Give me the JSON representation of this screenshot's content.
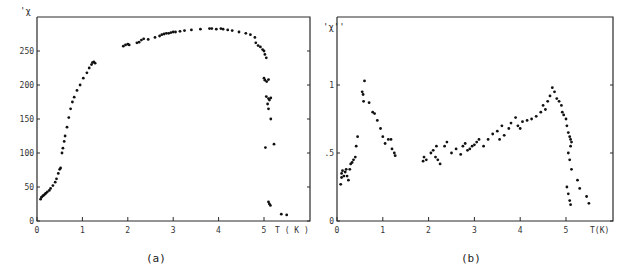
{
  "chart_data": [
    {
      "type": "scatter",
      "panel": "(a)",
      "caption": "(a)",
      "title": "",
      "ylabel": "'χ",
      "xlabel": "T(K)",
      "xlim": [
        0,
        5.8
      ],
      "ylim": [
        0,
        300
      ],
      "xticks": [
        "0",
        "1",
        "2",
        "3",
        "4",
        "5"
      ],
      "yticks": [
        "0",
        "50",
        "100",
        "150",
        "200",
        "250"
      ],
      "grid": false,
      "points": [
        [
          0.08,
          32
        ],
        [
          0.1,
          35
        ],
        [
          0.13,
          37
        ],
        [
          0.15,
          38
        ],
        [
          0.18,
          40
        ],
        [
          0.2,
          41
        ],
        [
          0.23,
          43
        ],
        [
          0.27,
          45
        ],
        [
          0.3,
          48
        ],
        [
          0.35,
          52
        ],
        [
          0.4,
          57
        ],
        [
          0.43,
          62
        ],
        [
          0.47,
          70
        ],
        [
          0.5,
          76
        ],
        [
          0.52,
          78
        ],
        [
          0.55,
          100
        ],
        [
          0.57,
          107
        ],
        [
          0.6,
          117
        ],
        [
          0.62,
          125
        ],
        [
          0.66,
          138
        ],
        [
          0.7,
          152
        ],
        [
          0.74,
          165
        ],
        [
          0.78,
          175
        ],
        [
          0.82,
          182
        ],
        [
          0.88,
          192
        ],
        [
          0.95,
          200
        ],
        [
          1.02,
          210
        ],
        [
          1.1,
          218
        ],
        [
          1.15,
          225
        ],
        [
          1.2,
          230
        ],
        [
          1.22,
          233
        ],
        [
          1.25,
          234
        ],
        [
          1.28,
          232
        ],
        [
          1.9,
          257
        ],
        [
          1.95,
          259
        ],
        [
          2.0,
          260
        ],
        [
          2.03,
          259
        ],
        [
          2.2,
          262
        ],
        [
          2.25,
          263
        ],
        [
          2.3,
          266
        ],
        [
          2.35,
          268
        ],
        [
          2.45,
          267
        ],
        [
          2.6,
          270
        ],
        [
          2.7,
          272
        ],
        [
          2.75,
          274
        ],
        [
          2.8,
          275
        ],
        [
          2.85,
          276
        ],
        [
          2.9,
          276
        ],
        [
          2.95,
          277
        ],
        [
          3.0,
          278
        ],
        [
          3.05,
          278
        ],
        [
          3.15,
          279
        ],
        [
          3.25,
          280
        ],
        [
          3.4,
          281
        ],
        [
          3.6,
          282
        ],
        [
          3.8,
          283
        ],
        [
          3.85,
          283
        ],
        [
          3.95,
          282
        ],
        [
          4.05,
          283
        ],
        [
          4.1,
          282
        ],
        [
          4.2,
          281
        ],
        [
          4.3,
          280
        ],
        [
          4.45,
          278
        ],
        [
          4.6,
          276
        ],
        [
          4.7,
          274
        ],
        [
          4.8,
          270
        ],
        [
          4.82,
          262
        ],
        [
          4.87,
          258
        ],
        [
          4.92,
          256
        ],
        [
          4.97,
          252
        ],
        [
          5.0,
          250
        ],
        [
          5.02,
          245
        ],
        [
          5.05,
          240
        ],
        [
          5.0,
          210
        ],
        [
          5.02,
          207
        ],
        [
          5.06,
          205
        ],
        [
          5.1,
          208
        ],
        [
          5.05,
          183
        ],
        [
          5.1,
          180
        ],
        [
          5.12,
          178
        ],
        [
          5.15,
          181
        ],
        [
          5.08,
          172
        ],
        [
          5.1,
          165
        ],
        [
          5.15,
          150
        ],
        [
          5.03,
          108
        ],
        [
          5.22,
          113
        ],
        [
          5.1,
          28
        ],
        [
          5.12,
          25
        ],
        [
          5.14,
          23
        ],
        [
          5.38,
          10
        ],
        [
          5.5,
          9
        ]
      ]
    },
    {
      "type": "scatter",
      "panel": "(b)",
      "caption": "(b)",
      "title": "",
      "ylabel": "'χ''",
      "xlabel": "T(K)",
      "xlim": [
        0,
        5.8
      ],
      "ylim": [
        0,
        1.5
      ],
      "xticks": [
        "0",
        "1",
        "2",
        "3",
        "4",
        "5"
      ],
      "yticks": [
        "0",
        ".5",
        "1"
      ],
      "grid": false,
      "points": [
        [
          0.08,
          0.27
        ],
        [
          0.1,
          0.32
        ],
        [
          0.1,
          0.35
        ],
        [
          0.12,
          0.37
        ],
        [
          0.15,
          0.33
        ],
        [
          0.18,
          0.36
        ],
        [
          0.2,
          0.38
        ],
        [
          0.22,
          0.33
        ],
        [
          0.25,
          0.3
        ],
        [
          0.28,
          0.38
        ],
        [
          0.3,
          0.42
        ],
        [
          0.33,
          0.43
        ],
        [
          0.36,
          0.45
        ],
        [
          0.4,
          0.47
        ],
        [
          0.42,
          0.55
        ],
        [
          0.45,
          0.62
        ],
        [
          0.55,
          0.95
        ],
        [
          0.57,
          0.93
        ],
        [
          0.6,
          1.03
        ],
        [
          0.58,
          0.88
        ],
        [
          0.7,
          0.87
        ],
        [
          0.78,
          0.8
        ],
        [
          0.82,
          0.79
        ],
        [
          0.88,
          0.74
        ],
        [
          0.95,
          0.68
        ],
        [
          1.0,
          0.62
        ],
        [
          1.05,
          0.57
        ],
        [
          1.12,
          0.6
        ],
        [
          1.18,
          0.6
        ],
        [
          1.2,
          0.53
        ],
        [
          1.25,
          0.5
        ],
        [
          1.27,
          0.48
        ],
        [
          1.88,
          0.44
        ],
        [
          1.9,
          0.47
        ],
        [
          1.95,
          0.45
        ],
        [
          2.05,
          0.5
        ],
        [
          2.1,
          0.52
        ],
        [
          2.15,
          0.47
        ],
        [
          2.17,
          0.55
        ],
        [
          2.2,
          0.45
        ],
        [
          2.25,
          0.42
        ],
        [
          2.35,
          0.55
        ],
        [
          2.4,
          0.58
        ],
        [
          2.5,
          0.5
        ],
        [
          2.6,
          0.53
        ],
        [
          2.7,
          0.49
        ],
        [
          2.75,
          0.55
        ],
        [
          2.8,
          0.57
        ],
        [
          2.85,
          0.52
        ],
        [
          2.9,
          0.53
        ],
        [
          2.95,
          0.55
        ],
        [
          3.0,
          0.56
        ],
        [
          3.05,
          0.58
        ],
        [
          3.1,
          0.6
        ],
        [
          3.2,
          0.55
        ],
        [
          3.3,
          0.6
        ],
        [
          3.4,
          0.64
        ],
        [
          3.5,
          0.66
        ],
        [
          3.55,
          0.6
        ],
        [
          3.6,
          0.7
        ],
        [
          3.65,
          0.63
        ],
        [
          3.75,
          0.68
        ],
        [
          3.8,
          0.72
        ],
        [
          3.9,
          0.76
        ],
        [
          3.95,
          0.7
        ],
        [
          4.0,
          0.68
        ],
        [
          4.05,
          0.73
        ],
        [
          4.15,
          0.74
        ],
        [
          4.25,
          0.75
        ],
        [
          4.35,
          0.77
        ],
        [
          4.45,
          0.8
        ],
        [
          4.5,
          0.85
        ],
        [
          4.55,
          0.82
        ],
        [
          4.6,
          0.88
        ],
        [
          4.65,
          0.92
        ],
        [
          4.7,
          0.98
        ],
        [
          4.75,
          0.95
        ],
        [
          4.8,
          0.9
        ],
        [
          4.85,
          0.88
        ],
        [
          4.9,
          0.85
        ],
        [
          4.92,
          0.8
        ],
        [
          4.95,
          0.78
        ],
        [
          5.0,
          0.75
        ],
        [
          5.02,
          0.7
        ],
        [
          5.05,
          0.65
        ],
        [
          5.08,
          0.62
        ],
        [
          5.1,
          0.6
        ],
        [
          5.12,
          0.58
        ],
        [
          5.1,
          0.55
        ],
        [
          5.05,
          0.5
        ],
        [
          5.08,
          0.45
        ],
        [
          5.12,
          0.38
        ],
        [
          5.02,
          0.25
        ],
        [
          5.05,
          0.2
        ],
        [
          5.08,
          0.15
        ],
        [
          5.1,
          0.12
        ],
        [
          5.25,
          0.3
        ],
        [
          5.3,
          0.24
        ],
        [
          5.45,
          0.18
        ],
        [
          5.5,
          0.13
        ]
      ]
    }
  ],
  "panels": {
    "a": {
      "ylabel": "'χ",
      "xlabel": "T ( K )",
      "caption": "(a)",
      "xticks": [
        "0",
        "1",
        "2",
        "3",
        "4",
        "5"
      ],
      "yticks": [
        "0",
        "50",
        "100",
        "150",
        "200",
        "250"
      ]
    },
    "b": {
      "ylabel": "'χ''",
      "xlabel": "T(K)",
      "caption": "(b)",
      "xticks": [
        "0",
        "1",
        "2",
        "3",
        "4",
        "5"
      ],
      "yticks": [
        "0",
        ".5",
        "1"
      ]
    }
  }
}
